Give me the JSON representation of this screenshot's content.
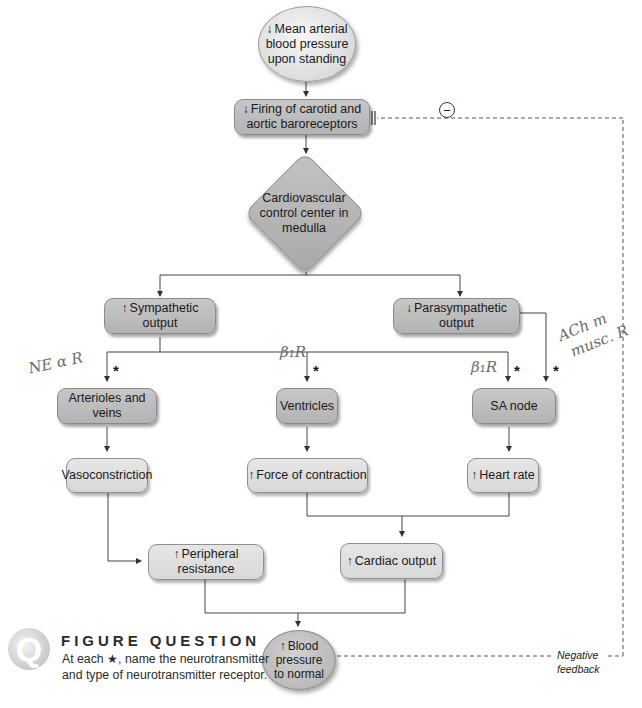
{
  "figure": {
    "nodes": {
      "map_drop": {
        "arrow": "↓",
        "text": "Mean arterial blood pressure upon standing"
      },
      "baroreceptors": {
        "arrow": "↓",
        "text": "Firing of carotid and aortic baroreceptors"
      },
      "control_center": {
        "text": "Cardiovascular control center in medulla"
      },
      "sympathetic": {
        "arrow": "↑",
        "text": "Sympathetic output"
      },
      "parasympathetic": {
        "arrow": "↓",
        "text": "Parasympathetic output"
      },
      "arterioles": {
        "text": "Arterioles and veins"
      },
      "ventricles": {
        "text": "Ventricles"
      },
      "sa_node": {
        "text": "SA node"
      },
      "vasoconstriction": {
        "text": "Vasoconstriction"
      },
      "force": {
        "arrow": "↑",
        "text": "Force of contraction"
      },
      "heart_rate": {
        "arrow": "↑",
        "text": "Heart rate"
      },
      "peripheral": {
        "arrow": "↑",
        "text": "Peripheral resistance"
      },
      "cardiac_output": {
        "arrow": "↑",
        "text": "Cardiac output"
      },
      "bp_normal": {
        "arrow": "↑",
        "text": "Blood pressure to normal"
      }
    },
    "feedback": {
      "inhibit_symbol": "−",
      "label_line1": "Negative",
      "label_line2": "feedback"
    },
    "star_symbol": "*",
    "handwritten": {
      "left": "NE α R",
      "middle": "β₁R",
      "right": "β₁R",
      "para_line1": "ACh m",
      "para_line2": "musc. R"
    }
  },
  "figure_question": {
    "icon_letter": "Q",
    "title": "FIGURE QUESTION",
    "body": "At each ★, name the neurotransmitter and type of neurotransmitter receptor."
  },
  "colors": {
    "dark_box": "#b9b9b9",
    "light_box": "#dedede",
    "line": "#333333"
  }
}
